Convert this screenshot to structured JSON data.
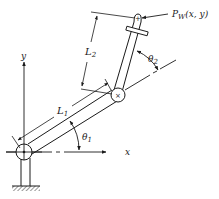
{
  "diagram": {
    "type": "two-link planar manipulator",
    "colors": {
      "ink": "#1a1a1a",
      "background": "#ffffff"
    },
    "axes": {
      "x_label": "x",
      "y_label": "y"
    },
    "links": [
      {
        "name": "L",
        "subscript": "1",
        "label": "L1"
      },
      {
        "name": "L",
        "subscript": "2",
        "label": "L2"
      }
    ],
    "angles": [
      {
        "name": "θ",
        "subscript": "1",
        "label": "θ1"
      },
      {
        "name": "θ",
        "subscript": "2",
        "label": "θ2"
      }
    ],
    "end_effector": {
      "point": "P",
      "subscript": "W",
      "coords": "(x, y)",
      "label": "Pw(x, y)"
    },
    "joint_marks": {
      "elbow": "×",
      "wrist": "+"
    }
  }
}
